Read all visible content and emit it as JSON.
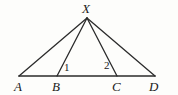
{
  "figure": {
    "kind": "geometry-diagram",
    "background_color": "#fdfdfb",
    "stroke_color": "#2b2b2b",
    "label_color": "#1a1a1a",
    "width": 178,
    "height": 95,
    "baseline_y": 76,
    "apex": {
      "name": "X",
      "x": 87,
      "y": 18
    },
    "points": [
      {
        "name": "A",
        "x": 19,
        "y": 76,
        "label_x": 14,
        "label_y": 80
      },
      {
        "name": "B",
        "x": 57,
        "y": 76,
        "label_x": 52,
        "label_y": 80
      },
      {
        "name": "C",
        "x": 117,
        "y": 76,
        "label_x": 112,
        "label_y": 80
      },
      {
        "name": "D",
        "x": 155,
        "y": 76,
        "label_x": 149,
        "label_y": 80
      }
    ],
    "apex_label": {
      "text": "X",
      "x": 82,
      "y": 2
    },
    "segments": [
      {
        "name": "base-A-D",
        "from": "A",
        "to": "D",
        "x1": 19,
        "y1": 76,
        "x2": 155,
        "y2": 76,
        "width": 1.6
      },
      {
        "name": "cevian-X-A",
        "from": "X",
        "to": "A",
        "x1": 87,
        "y1": 18,
        "x2": 19,
        "y2": 76,
        "width": 1.3
      },
      {
        "name": "cevian-X-B",
        "from": "X",
        "to": "B",
        "x1": 87,
        "y1": 18,
        "x2": 57,
        "y2": 76,
        "width": 1.3
      },
      {
        "name": "cevian-X-C",
        "from": "X",
        "to": "C",
        "x1": 87,
        "y1": 18,
        "x2": 117,
        "y2": 76,
        "width": 1.3
      },
      {
        "name": "cevian-X-D",
        "from": "X",
        "to": "D",
        "x1": 87,
        "y1": 18,
        "x2": 155,
        "y2": 76,
        "width": 1.3
      }
    ],
    "angle_labels": [
      {
        "name": "angle-1",
        "text": "1",
        "x": 64,
        "y": 62,
        "at_vertex": "B"
      },
      {
        "name": "angle-2",
        "text": "2",
        "x": 104,
        "y": 60,
        "at_vertex": "C"
      }
    ]
  }
}
